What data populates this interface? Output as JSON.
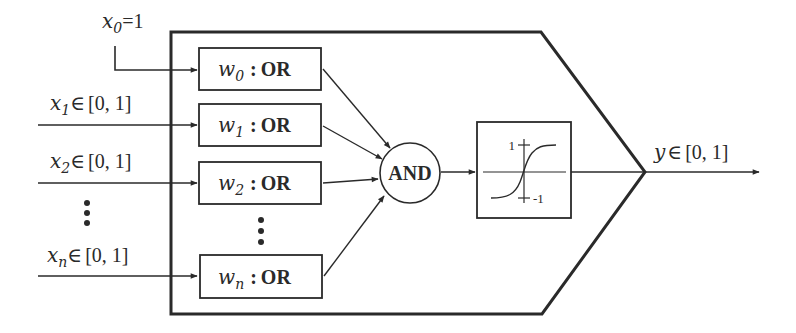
{
  "diagram": {
    "colors": {
      "stroke": "#2a2a2a",
      "background": "#ffffff"
    },
    "inputs": [
      {
        "id": "x0",
        "var": "x",
        "sub": "0",
        "rel": "=",
        "domain": "1"
      },
      {
        "id": "x1",
        "var": "x",
        "sub": "1",
        "rel": "∈",
        "domain": "[0, 1]"
      },
      {
        "id": "x2",
        "var": "x",
        "sub": "2",
        "rel": "∈",
        "domain": "[0, 1]"
      },
      {
        "id": "xn",
        "var": "x",
        "sub": "n",
        "rel": "∈",
        "domain": "[0, 1]"
      }
    ],
    "input_ellipsis": "⋮",
    "or_units": [
      {
        "weight": "w",
        "sub": "0",
        "sep": ":",
        "op": "OR"
      },
      {
        "weight": "w",
        "sub": "1",
        "sep": ":",
        "op": "OR"
      },
      {
        "weight": "w",
        "sub": "2",
        "sep": ":",
        "op": "OR"
      },
      {
        "weight": "w",
        "sub": "n",
        "sep": ":",
        "op": "OR"
      }
    ],
    "or_ellipsis": "⋮",
    "and_unit": {
      "label": "AND"
    },
    "activation": {
      "type": "sigmoid",
      "upper_label": "1",
      "lower_label": "-1"
    },
    "output": {
      "var": "y",
      "rel": "∈",
      "domain": "[0, 1]"
    }
  }
}
